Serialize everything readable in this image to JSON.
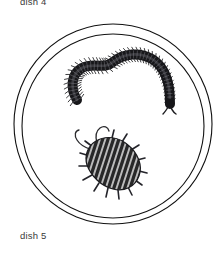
{
  "canvas": {
    "width": 223,
    "height": 253,
    "background_color": "#ffffff"
  },
  "labels": {
    "top": {
      "text": "dish 4",
      "x": 20,
      "y": 5,
      "note": "clipped at top edge of image"
    },
    "bottom": {
      "text": "dish 5",
      "x": 20,
      "y": 239
    }
  },
  "petri_dish": {
    "name": "petri-dish",
    "center_x": 113,
    "center_y": 124,
    "outer_rx": 99,
    "outer_ry": 100,
    "inner_rx": 91,
    "inner_ry": 92,
    "stroke_color": "#111111",
    "stroke_width": 1.1,
    "fill": "none"
  },
  "specimens": [
    {
      "id": "millipede",
      "name": "millipede",
      "common_name": "millipede",
      "body_color": "#17171a",
      "leg_color": "#1d1d20",
      "segment_count": 46,
      "position": {
        "x": 66,
        "y": 47,
        "width": 110,
        "height": 62
      },
      "description": "long curved S-shaped segmented body with dense legs along both sides, tapering head with antennae at right"
    },
    {
      "id": "woodlouse",
      "name": "woodlouse",
      "common_name": "woodlouse",
      "body_color": "#2a2a2d",
      "stripe_color": "#d8d8d8",
      "segment_count": 11,
      "antenna_count": 2,
      "position": {
        "x": 72,
        "y": 128,
        "width": 72,
        "height": 64
      },
      "description": "oval striped segmented isopod body with short legs and two long curved antennae to the upper left"
    }
  ]
}
